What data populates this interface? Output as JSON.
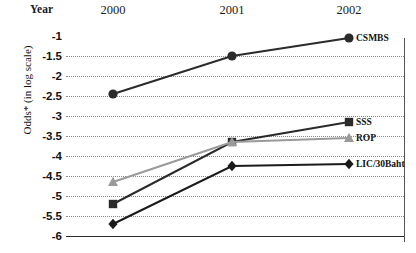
{
  "axes": {
    "year_word": "Year",
    "y_title": "Odds* (in log scale)",
    "x_tick_labels": [
      "2000",
      "2001",
      "2002"
    ],
    "y_tick_labels": [
      "-1",
      "-1.5",
      "-2",
      "-2.5",
      "-3",
      "-3.5",
      "-4",
      "-4.5",
      "-5",
      "-5.5",
      "-6"
    ]
  },
  "colors": {
    "csmbs": "#2b2b2b",
    "sss": "#2b2b2b",
    "rop": "#9a9a9a",
    "lic": "#1a1a1a",
    "gridline": "#8a8a8a",
    "axis": "#2b2b2b",
    "text": "#111111",
    "background": "#ffffff"
  },
  "chart_data": {
    "type": "line",
    "title": "",
    "xlabel": "Year",
    "ylabel": "Odds* (in log scale)",
    "x": [
      "2000",
      "2001",
      "2002"
    ],
    "ylim": [
      -6,
      -1
    ],
    "xlim": [
      "2000",
      "2002"
    ],
    "grid": true,
    "y_ticks": [
      -1,
      -1.5,
      -2,
      -2.5,
      -3,
      -3.5,
      -4,
      -4.5,
      -5,
      -5.5,
      -6
    ],
    "legend_position": "right-inline-end-labels",
    "series": [
      {
        "name": "CSMBS",
        "marker": "circle",
        "color": "#2b2b2b",
        "values": [
          -2.45,
          -1.5,
          -1.05
        ]
      },
      {
        "name": "SSS",
        "marker": "square",
        "color": "#2b2b2b",
        "values": [
          -5.2,
          -3.65,
          -3.15
        ]
      },
      {
        "name": "ROP",
        "marker": "triangle",
        "color": "#9a9a9a",
        "values": [
          -4.65,
          -3.65,
          -3.55
        ]
      },
      {
        "name": "LIC/30Baht",
        "marker": "diamond",
        "color": "#1a1a1a",
        "values": [
          -5.7,
          -4.25,
          -4.2
        ]
      }
    ]
  }
}
